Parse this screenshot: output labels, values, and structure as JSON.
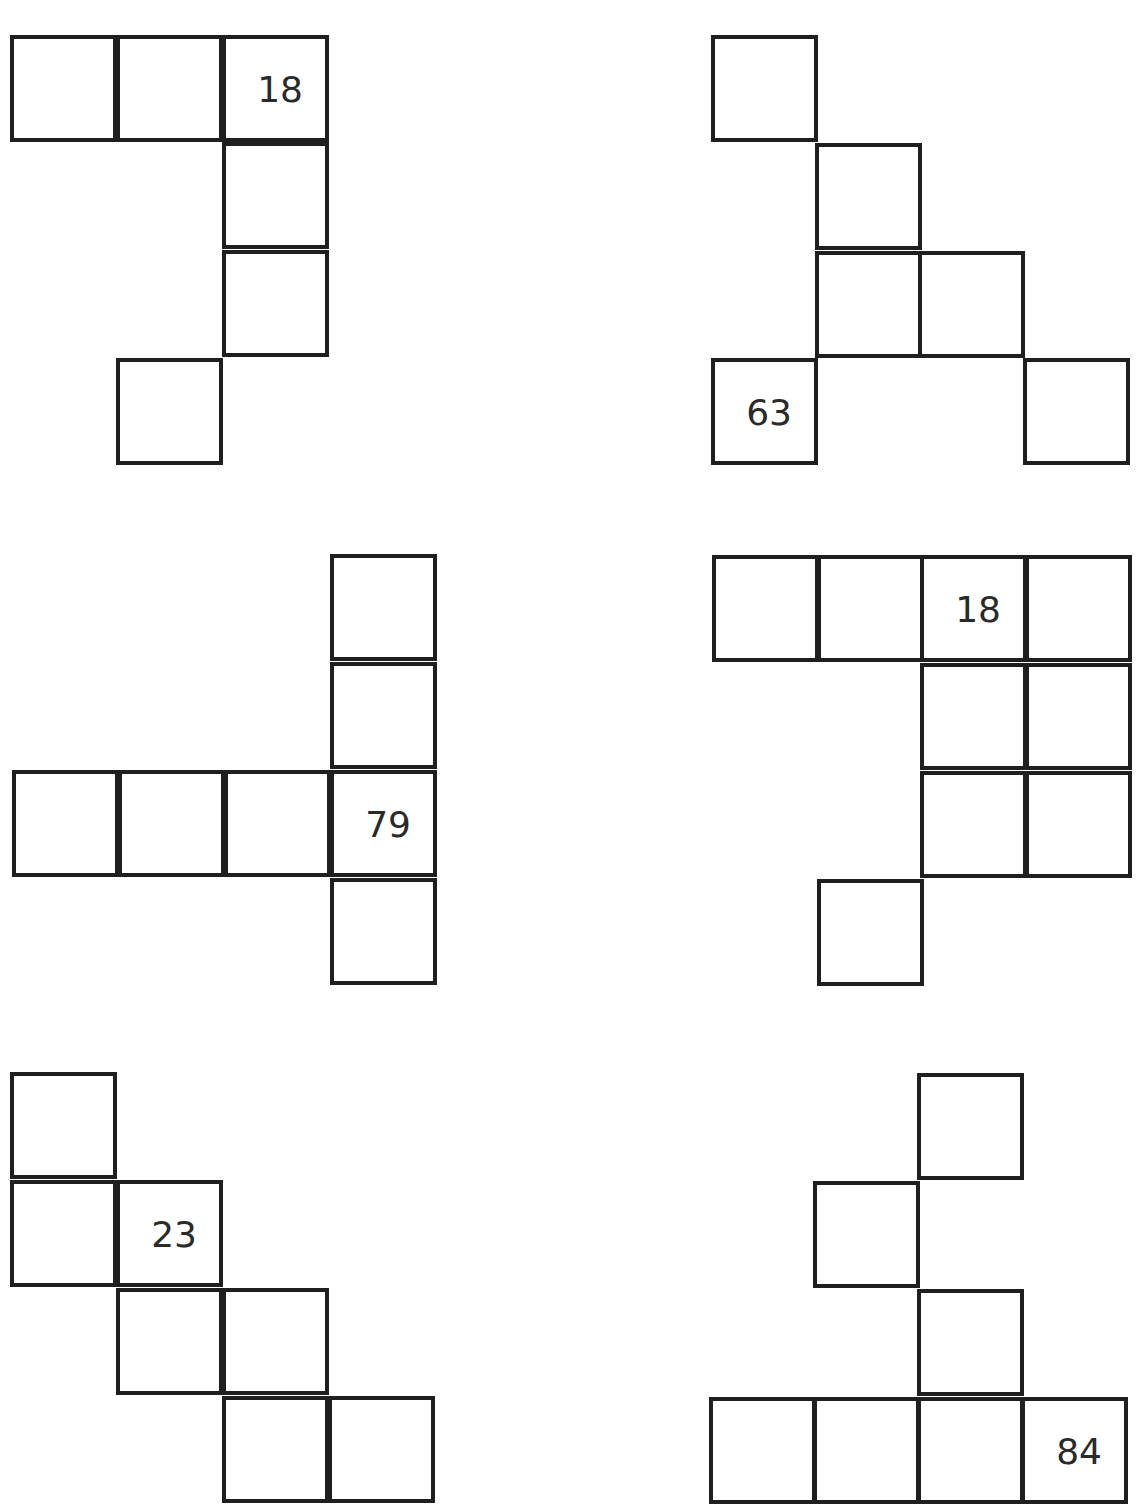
{
  "stroke_color": "#1f1f1f",
  "figures": [
    {
      "id": "fig-1",
      "cells": [
        {
          "x": 10,
          "y": 35,
          "value": ""
        },
        {
          "x": 116,
          "y": 35,
          "value": ""
        },
        {
          "x": 222,
          "y": 35,
          "value": "18"
        },
        {
          "x": 222,
          "y": 142,
          "value": ""
        },
        {
          "x": 222,
          "y": 250,
          "value": ""
        },
        {
          "x": 116,
          "y": 358,
          "value": ""
        }
      ]
    },
    {
      "id": "fig-2",
      "cells": [
        {
          "x": 711,
          "y": 35,
          "value": ""
        },
        {
          "x": 815,
          "y": 143,
          "value": ""
        },
        {
          "x": 815,
          "y": 251,
          "value": ""
        },
        {
          "x": 918,
          "y": 251,
          "value": ""
        },
        {
          "x": 711,
          "y": 358,
          "value": "63"
        },
        {
          "x": 1023,
          "y": 358,
          "value": ""
        }
      ]
    },
    {
      "id": "fig-3",
      "cells": [
        {
          "x": 330,
          "y": 554,
          "value": ""
        },
        {
          "x": 330,
          "y": 662,
          "value": ""
        },
        {
          "x": 12,
          "y": 770,
          "value": ""
        },
        {
          "x": 118,
          "y": 770,
          "value": ""
        },
        {
          "x": 224,
          "y": 770,
          "value": ""
        },
        {
          "x": 330,
          "y": 770,
          "value": "79"
        },
        {
          "x": 330,
          "y": 878,
          "value": ""
        }
      ]
    },
    {
      "id": "fig-4",
      "cells": [
        {
          "x": 712,
          "y": 555,
          "value": ""
        },
        {
          "x": 817,
          "y": 555,
          "value": ""
        },
        {
          "x": 920,
          "y": 555,
          "value": "18"
        },
        {
          "x": 1025,
          "y": 555,
          "value": ""
        },
        {
          "x": 920,
          "y": 663,
          "value": ""
        },
        {
          "x": 1025,
          "y": 663,
          "value": ""
        },
        {
          "x": 920,
          "y": 771,
          "value": ""
        },
        {
          "x": 1025,
          "y": 771,
          "value": ""
        },
        {
          "x": 817,
          "y": 879,
          "value": ""
        }
      ]
    },
    {
      "id": "fig-5",
      "cells": [
        {
          "x": 10,
          "y": 1072,
          "value": ""
        },
        {
          "x": 10,
          "y": 1180,
          "value": ""
        },
        {
          "x": 116,
          "y": 1180,
          "value": "23"
        },
        {
          "x": 116,
          "y": 1288,
          "value": ""
        },
        {
          "x": 222,
          "y": 1288,
          "value": ""
        },
        {
          "x": 222,
          "y": 1396,
          "value": ""
        },
        {
          "x": 328,
          "y": 1396,
          "value": ""
        }
      ]
    },
    {
      "id": "fig-6",
      "cells": [
        {
          "x": 917,
          "y": 1073,
          "value": ""
        },
        {
          "x": 813,
          "y": 1181,
          "value": ""
        },
        {
          "x": 917,
          "y": 1289,
          "value": ""
        },
        {
          "x": 709,
          "y": 1397,
          "value": ""
        },
        {
          "x": 813,
          "y": 1397,
          "value": ""
        },
        {
          "x": 917,
          "y": 1397,
          "value": ""
        },
        {
          "x": 1021,
          "y": 1397,
          "value": "84"
        }
      ]
    }
  ]
}
